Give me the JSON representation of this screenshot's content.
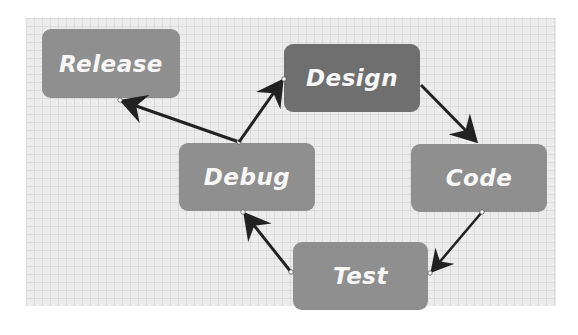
{
  "diagram": {
    "type": "cycle-flow",
    "colors": {
      "background": "#ffffff",
      "canvas": "#ececec",
      "node_fill": "#8f8f8f",
      "node_fill_highlight": "#6f6f6f",
      "node_text": "#f7f7f7",
      "arrow": "#222222"
    },
    "nodes": [
      {
        "id": "release",
        "label": "Release",
        "highlight": false
      },
      {
        "id": "design",
        "label": "Design",
        "highlight": true
      },
      {
        "id": "debug",
        "label": "Debug",
        "highlight": false
      },
      {
        "id": "code",
        "label": "Code",
        "highlight": false
      },
      {
        "id": "test",
        "label": "Test",
        "highlight": false
      }
    ],
    "edges": [
      {
        "from": "debug",
        "to": "release"
      },
      {
        "from": "debug",
        "to": "design"
      },
      {
        "from": "design",
        "to": "code"
      },
      {
        "from": "code",
        "to": "test"
      },
      {
        "from": "test",
        "to": "debug"
      }
    ]
  }
}
